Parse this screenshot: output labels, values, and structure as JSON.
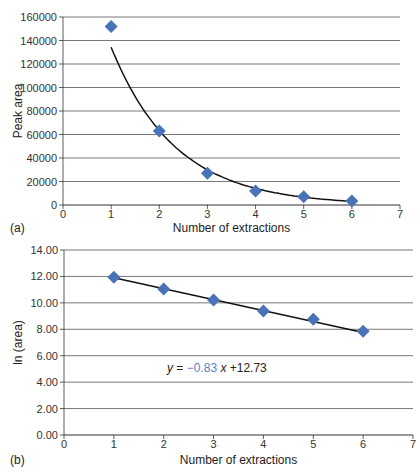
{
  "colors": {
    "marker": "#4a72b8",
    "line": "#111111",
    "grid": "#555555",
    "equation_coef": "#5b83c8"
  },
  "chart_data": [
    {
      "type": "scatter",
      "panel_label": "(a)",
      "title": "",
      "xlabel": "Number of extractions",
      "ylabel": "Peak area",
      "xlim": [
        0,
        7
      ],
      "ylim": [
        0,
        160000
      ],
      "xticks": [
        "0",
        "1",
        "2",
        "3",
        "4",
        "5",
        "6",
        "7"
      ],
      "yticks": [
        "0",
        "20000",
        "40000",
        "60000",
        "80000",
        "100000",
        "120000",
        "140000",
        "160000"
      ],
      "grid": "horizontal",
      "trendline": "exponential",
      "x": [
        1,
        2,
        3,
        4,
        5,
        6
      ],
      "y": [
        152000,
        63000,
        27000,
        12000,
        7000,
        3500
      ]
    },
    {
      "type": "scatter",
      "panel_label": "(b)",
      "title": "",
      "xlabel": "Number of extractions",
      "ylabel": "ln (area)",
      "xlim": [
        0,
        7
      ],
      "ylim": [
        0,
        14
      ],
      "xticks": [
        "0",
        "1",
        "2",
        "3",
        "4",
        "5",
        "6",
        "7"
      ],
      "yticks": [
        "0.00",
        "2.00",
        "4.00",
        "6.00",
        "8.00",
        "10.00",
        "12.00",
        "14.00"
      ],
      "grid": "horizontal",
      "trendline": "linear",
      "x": [
        1,
        2,
        3,
        4,
        5,
        6
      ],
      "y": [
        11.93,
        11.05,
        10.21,
        9.39,
        8.76,
        7.86
      ],
      "annotation": {
        "prefix": "y = ",
        "slope": "−0.83",
        "suffix": " x +12.73",
        "slope_value": -0.83,
        "intercept": 12.73
      }
    }
  ]
}
